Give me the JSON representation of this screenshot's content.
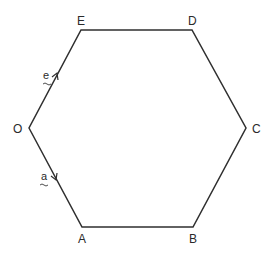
{
  "diagram": {
    "type": "regular hexagon with vectors",
    "stroke_color": "#2f2f2f",
    "text_color": "#2a2a2a",
    "vertices": [
      {
        "name": "O",
        "x": 29,
        "y": 128,
        "label_x": 18,
        "label_y": 133
      },
      {
        "name": "A",
        "x": 82,
        "y": 227,
        "label_x": 82,
        "label_y": 243
      },
      {
        "name": "B",
        "x": 193,
        "y": 227,
        "label_x": 193,
        "label_y": 243
      },
      {
        "name": "C",
        "x": 246,
        "y": 128,
        "label_x": 257,
        "label_y": 133
      },
      {
        "name": "D",
        "x": 192,
        "y": 30,
        "label_x": 193,
        "label_y": 25
      },
      {
        "name": "E",
        "x": 81,
        "y": 30,
        "label_x": 82,
        "label_y": 25
      }
    ],
    "labels": {
      "O": "O",
      "A": "A",
      "B": "B",
      "C": "C",
      "D": "D",
      "E": "E"
    },
    "vectors": [
      {
        "name": "a",
        "label": "a",
        "from": "O",
        "to": "A",
        "underline": "~"
      },
      {
        "name": "e",
        "label": "e",
        "from": "O",
        "to": "E",
        "underline": "~"
      }
    ]
  }
}
